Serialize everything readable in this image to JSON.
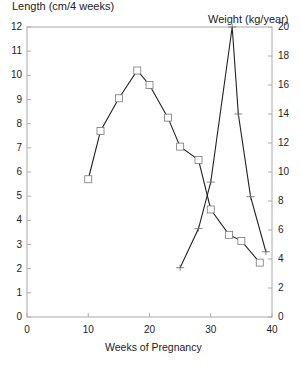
{
  "chart_data": {
    "type": "line",
    "title": "",
    "xlabel": "Weeks of Pregnancy",
    "ylabel_left": "Length (cm/4 weeks)",
    "ylabel_right": "Weight (kg/year)",
    "xlim": [
      0,
      40
    ],
    "ylim_left": [
      0,
      12
    ],
    "ylim_right": [
      0,
      20
    ],
    "x_ticks": [
      0,
      10,
      20,
      30,
      40
    ],
    "y_ticks_left": [
      0,
      1,
      2,
      3,
      4,
      5,
      6,
      7,
      8,
      9,
      10,
      11,
      12
    ],
    "y_ticks_right": [
      0,
      2,
      4,
      6,
      8,
      10,
      12,
      14,
      16,
      18,
      20
    ],
    "grid": false,
    "legend": null,
    "series": [
      {
        "name": "Length",
        "axis": "left",
        "marker": "square",
        "x": [
          10,
          12,
          15,
          18,
          20,
          23,
          25,
          28,
          30,
          33,
          35,
          38
        ],
        "values": [
          5.7,
          7.7,
          9.05,
          10.2,
          9.6,
          8.25,
          7.05,
          6.5,
          4.45,
          3.4,
          3.15,
          2.25
        ]
      },
      {
        "name": "Weight",
        "axis": "right",
        "marker": "plus",
        "x": [
          25,
          28,
          30,
          33.5,
          34.5,
          36.5,
          39
        ],
        "values": [
          3.4,
          6.1,
          9.3,
          20,
          14,
          8.3,
          4.5
        ]
      }
    ]
  }
}
